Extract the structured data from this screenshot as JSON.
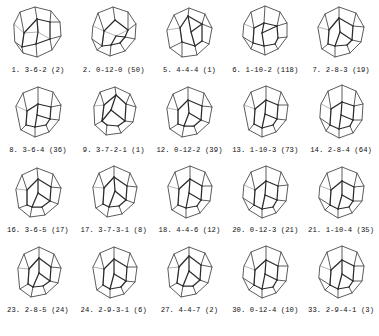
{
  "figure": {
    "rows": 4,
    "columns": 5,
    "line_color": "#4a4a4a",
    "front_edge_color": "#2b2b2b",
    "back_edge_color": "#9a9a9a",
    "background": "#ffffff"
  },
  "items": [
    {
      "index": "1.",
      "vector": "3-6-2",
      "count": "(2)",
      "caption": "1. 3-6-2   (2)"
    },
    {
      "index": "2.",
      "vector": "0-12-0",
      "count": "(50)",
      "caption": "2. 0-12-0  (50)"
    },
    {
      "index": "5.",
      "vector": "4-4-4",
      "count": "(1)",
      "caption": "5. 4-4-4   (1)"
    },
    {
      "index": "6.",
      "vector": "1-10-2",
      "count": "(118)",
      "caption": "6. 1-10-2 (118)"
    },
    {
      "index": "7.",
      "vector": "2-8-3",
      "count": "(19)",
      "caption": "7. 2-8-3   (19)"
    },
    {
      "index": "8.",
      "vector": "3-6-4",
      "count": "(36)",
      "caption": "8. 3-6-4   (36)"
    },
    {
      "index": "9.",
      "vector": "3-7-2-1",
      "count": "(1)",
      "caption": "9. 3-7-2-1  (1)"
    },
    {
      "index": "12.",
      "vector": "0-12-2",
      "count": "(39)",
      "caption": "12. 0-12-2 (39)"
    },
    {
      "index": "13.",
      "vector": "1-10-3",
      "count": "(73)",
      "caption": "13. 1-10-3 (73)"
    },
    {
      "index": "14.",
      "vector": "2-8-4",
      "count": "(64)",
      "caption": "14. 2-8-4  (64)"
    },
    {
      "index": "16.",
      "vector": "3-6-5",
      "count": "(17)",
      "caption": "16. 3-6-5  (17)"
    },
    {
      "index": "17.",
      "vector": "3-7-3-1",
      "count": "(8)",
      "caption": "17. 3-7-3-1 (8)"
    },
    {
      "index": "18.",
      "vector": "4-4-6",
      "count": "(12)",
      "caption": "18. 4-4-6  (12)"
    },
    {
      "index": "20.",
      "vector": "0-12-3",
      "count": "(21)",
      "caption": "20. 0-12-3 (21)"
    },
    {
      "index": "21.",
      "vector": "1-10-4",
      "count": "(35)",
      "caption": "21. 1-10-4 (35)"
    },
    {
      "index": "23.",
      "vector": "2-8-5",
      "count": "(24)",
      "caption": "23. 2-8-5  (24)"
    },
    {
      "index": "24.",
      "vector": "2-9-3-1",
      "count": "(6)",
      "caption": "24. 2-9-3-1 (6)"
    },
    {
      "index": "27.",
      "vector": "4-4-7",
      "count": "(2)",
      "caption": "27. 4-4-7   (2)"
    },
    {
      "index": "30.",
      "vector": "0-12-4",
      "count": "(10)",
      "caption": "30. 0-12-4 (10)"
    },
    {
      "index": "33.",
      "vector": "2-9-4-1",
      "count": "(3)",
      "caption": "33. 2-9-4-1 (3)"
    }
  ]
}
